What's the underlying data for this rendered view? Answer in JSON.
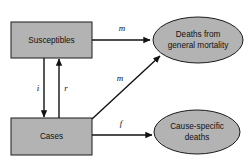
{
  "diagram": {
    "canvas": {
      "width": 249,
      "height": 168,
      "background": "#ffffff"
    },
    "style": {
      "shape_fill": "#b3b3b3",
      "shape_stroke": "#1a1a1a",
      "edge_color": "#111111",
      "label_color": "#111111"
    },
    "nodes": [
      {
        "id": "susceptibles",
        "shape": "rectangle",
        "label": "Susceptibles",
        "x": 11,
        "y": 22,
        "width": 81,
        "height": 36
      },
      {
        "id": "cases",
        "shape": "rectangle",
        "label": "Cases",
        "x": 11,
        "y": 118,
        "width": 81,
        "height": 37
      },
      {
        "id": "deaths-general",
        "shape": "ellipse",
        "label_line1": "Deaths from",
        "label_line2": "general mortality",
        "cx": 198,
        "cy": 40,
        "rx": 45,
        "ry": 23
      },
      {
        "id": "cause-specific-deaths",
        "shape": "ellipse",
        "label_line1": "Cause-specific",
        "label_line2": "deaths",
        "cx": 197,
        "cy": 132,
        "rx": 43,
        "ry": 22
      }
    ],
    "edges": [
      {
        "id": "susceptibles-to-deaths-general",
        "from": "susceptibles",
        "to": "deaths-general",
        "label": "m",
        "label_x": 122,
        "label_y": 29,
        "x1": 92,
        "y1": 40,
        "x2": 151,
        "y2": 40
      },
      {
        "id": "susceptibles-to-cases",
        "from": "susceptibles",
        "to": "cases",
        "label": "i",
        "label_x": 38,
        "label_y": 89,
        "x1": 44,
        "y1": 58,
        "x2": 44,
        "y2": 118
      },
      {
        "id": "cases-to-susceptibles",
        "from": "cases",
        "to": "susceptibles",
        "label": "r",
        "label_x": 66,
        "label_y": 89,
        "x1": 59,
        "y1": 118,
        "x2": 59,
        "y2": 58
      },
      {
        "id": "cases-to-deaths-general",
        "from": "cases",
        "to": "deaths-general",
        "label": "m",
        "label_x": 120,
        "label_y": 79,
        "x1": 92,
        "y1": 119,
        "x2": 161,
        "y2": 55
      },
      {
        "id": "cases-to-cause-specific-deaths",
        "from": "cases",
        "to": "cause-specific-deaths",
        "label": "f",
        "label_x": 121,
        "label_y": 124,
        "x1": 92,
        "y1": 135,
        "x2": 153,
        "y2": 135
      }
    ]
  }
}
